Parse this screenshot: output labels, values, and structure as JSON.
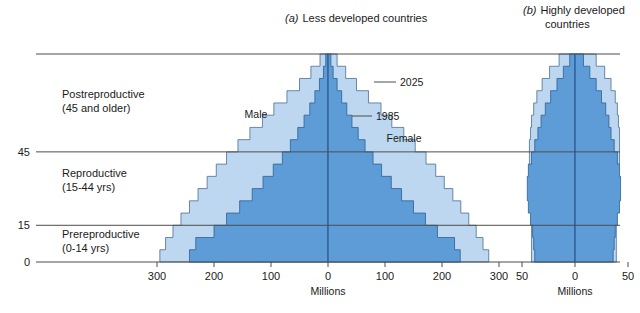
{
  "figure": {
    "background": "#ffffff",
    "colors": {
      "series_2025": "#bcd7ef",
      "series_1985": "#5e9cd8",
      "outline_2025": "#4a6f93",
      "outline_1985": "#2e5f93",
      "rule": "#4d4d4d",
      "text": "#1a1a1a"
    }
  },
  "panel_a": {
    "title_prefix": "(a)",
    "title": "Less developed countries",
    "axis_label": "Millions",
    "xticks": [
      "300",
      "200",
      "100",
      "0",
      "100",
      "200",
      "300"
    ],
    "inline_labels": {
      "male": "Male",
      "female": "Female",
      "series_outer": "2025",
      "series_inner": "1985"
    }
  },
  "panel_b": {
    "title_prefix": "(b)",
    "title_line1": "Highly developed",
    "title_line2": "countries",
    "axis_label": "Millions",
    "xticks": [
      "50",
      "0",
      "50"
    ]
  },
  "age_axis": {
    "ticks": [
      "0",
      "15",
      "45"
    ],
    "categories": [
      {
        "label_line1": "Postreproductive",
        "label_line2": "(45 and older)"
      },
      {
        "label_line1": "Reproductive",
        "label_line2": "(15-44 yrs)"
      },
      {
        "label_line1": "Prereproductive",
        "label_line2": "(0-14 yrs)"
      }
    ]
  },
  "chart_data": {
    "type": "bar",
    "subtype": "population-pyramid",
    "xlabel": "Millions",
    "ylabel": "Age (years)",
    "grid": false,
    "legend_position": "inline-annotations",
    "age_groups": [
      "0-4",
      "5-9",
      "10-14",
      "15-19",
      "20-24",
      "25-29",
      "30-34",
      "35-39",
      "40-44",
      "45-49",
      "50-54",
      "55-59",
      "60-64",
      "65-69",
      "70-74",
      "75-79",
      "80+"
    ],
    "age_bounds": [
      0,
      85
    ],
    "reference_lines_age": [
      0,
      15,
      45
    ],
    "panels": [
      {
        "name": "Less developed countries",
        "panel_id": "a",
        "xlim": [
          -300,
          300
        ],
        "xticks": [
          -300,
          -200,
          -100,
          0,
          100,
          200,
          300
        ],
        "series": [
          {
            "name": "2025",
            "male": [
              295,
              285,
              272,
              258,
              243,
              228,
              212,
              196,
              178,
              158,
              137,
              115,
              95,
              72,
              50,
              30,
              14
            ],
            "female": [
              282,
              272,
              260,
              247,
              233,
              219,
              204,
              189,
              172,
              153,
              133,
              112,
              93,
              71,
              50,
              31,
              16
            ]
          },
          {
            "name": "1985",
            "male": [
              243,
              232,
              200,
              178,
              155,
              133,
              114,
              96,
              80,
              66,
              53,
              42,
              32,
              23,
              15,
              8,
              4
            ],
            "female": [
              232,
              222,
              192,
              171,
              150,
              129,
              111,
              94,
              79,
              65,
              53,
              42,
              33,
              24,
              16,
              9,
              5
            ]
          }
        ]
      },
      {
        "name": "Highly developed countries",
        "panel_id": "b",
        "xlim": [
          -50,
          50
        ],
        "xticks": [
          -50,
          0,
          50
        ],
        "series": [
          {
            "name": "2025",
            "male": [
              41,
              41,
              41,
              41,
              41,
              42,
              42,
              43,
              43,
              43,
              42,
              41,
              39,
              36,
              31,
              24,
              15
            ],
            "female": [
              39,
              39,
              39,
              39,
              40,
              40,
              41,
              41,
              42,
              42,
              42,
              41,
              40,
              38,
              34,
              28,
              20
            ]
          },
          {
            "name": "1985",
            "male": [
              38,
              39,
              40,
              42,
              44,
              45,
              45,
              44,
              41,
              38,
              35,
              32,
              28,
              23,
              17,
              11,
              5
            ],
            "female": [
              36,
              37,
              38,
              40,
              42,
              43,
              43,
              42,
              40,
              37,
              34,
              32,
              29,
              25,
              20,
              14,
              8
            ]
          }
        ]
      }
    ]
  }
}
